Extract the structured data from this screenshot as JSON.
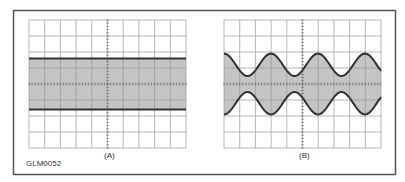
{
  "figure": {
    "id_label": "GLM0052",
    "panels": [
      {
        "label": "(A)",
        "type": "unmodulated-carrier",
        "grid": {
          "cols": 10,
          "rows": 8
        },
        "band_top_div": 2.4,
        "band_bottom_div": 5.6
      },
      {
        "label": "(B)",
        "type": "amplitude-modulated-carrier",
        "grid": {
          "cols": 10,
          "rows": 8
        },
        "envelope_max_div": 2.1,
        "envelope_min_div": 3.5,
        "cycles": 3.33
      }
    ],
    "colors": {
      "frame": "#555555",
      "grid": "#9a9a9a",
      "band_fill": "#c4c4c4",
      "trace": "#333333",
      "text": "#333333"
    }
  },
  "chart_data": [
    {
      "type": "area",
      "title": "(A)",
      "description": "Oscilloscope display of unmodulated carrier: constant-amplitude shaded band",
      "grid": true,
      "divisions": {
        "x": 10,
        "y": 8
      },
      "x": [
        0,
        10
      ],
      "upper_envelope": [
        2.4,
        2.4
      ],
      "lower_envelope": [
        5.6,
        5.6
      ]
    },
    {
      "type": "area",
      "title": "(B)",
      "description": "Oscilloscope display of amplitude-modulated carrier: sinusoidal envelope",
      "grid": true,
      "divisions": {
        "x": 10,
        "y": 8
      },
      "x": [
        0,
        1.5,
        3,
        4.5,
        6,
        7.5,
        9,
        10
      ],
      "upper_envelope": [
        2.1,
        3.5,
        2.1,
        3.5,
        2.1,
        3.5,
        2.1,
        3.0
      ],
      "lower_envelope": [
        5.9,
        4.5,
        5.9,
        4.5,
        5.9,
        4.5,
        5.9,
        5.0
      ]
    }
  ]
}
